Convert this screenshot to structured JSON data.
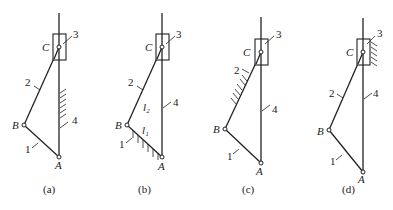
{
  "figure": {
    "panels": [
      {
        "id": "a",
        "caption": "(a)",
        "ground_link": "4",
        "ox": 0,
        "oy": 0,
        "points": {
          "A": [
            59,
            157
          ],
          "B": [
            24,
            125
          ],
          "C": [
            59,
            47
          ]
        },
        "box": [
          53,
          34,
          13,
          26
        ],
        "labels": {
          "A": "A",
          "B": "B",
          "C": "C",
          "n1": "1",
          "n2": "2",
          "n3": "3",
          "n4": "4"
        }
      },
      {
        "id": "b",
        "caption": "(b)",
        "ground_link": "1",
        "points": {
          "A": [
            162,
            157
          ],
          "B": [
            127,
            125
          ],
          "C": [
            162,
            47
          ]
        },
        "box": [
          156,
          34,
          13,
          26
        ],
        "labels": {
          "A": "A",
          "B": "B",
          "C": "C",
          "n1": "1",
          "n2": "2",
          "n3": "3",
          "n4": "4",
          "l1": "l₁",
          "l2": "l₂"
        }
      },
      {
        "id": "c",
        "caption": "(c)",
        "ground_link": "2",
        "points": {
          "A": [
            261,
            163
          ],
          "B": [
            225,
            129
          ],
          "C": [
            261,
            52
          ]
        },
        "box": [
          255,
          39,
          13,
          26
        ],
        "labels": {
          "A": "A",
          "B": "B",
          "C": "C",
          "n1": "1",
          "n2": "2",
          "n3": "3",
          "n4": "4"
        }
      },
      {
        "id": "d",
        "caption": "(d)",
        "ground_link": "3",
        "points": {
          "A": [
            363,
            172
          ],
          "B": [
            329,
            130
          ],
          "C": [
            363,
            52
          ]
        },
        "box": [
          357,
          39,
          13,
          26
        ],
        "labels": {
          "A": "A",
          "B": "B",
          "C": "C",
          "n1": "1",
          "n2": "2",
          "n3": "3",
          "n4": "4"
        }
      }
    ]
  }
}
